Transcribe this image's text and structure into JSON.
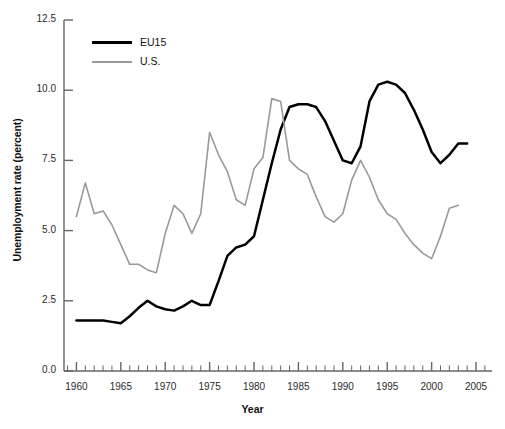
{
  "chart_data": {
    "type": "line",
    "title": "",
    "xlabel": "Year",
    "ylabel": "Unemployment rate (percent)",
    "xlim": [
      1958.6,
      2006.8
    ],
    "ylim": [
      0.0,
      12.5
    ],
    "grid": false,
    "legend_position": "top-left inside axes",
    "y_ticks": [
      "0.0",
      "2.5",
      "5.0",
      "7.5",
      "10.0",
      "12.5"
    ],
    "y_tick_values": [
      0.0,
      2.5,
      5.0,
      7.5,
      10.0,
      12.5
    ],
    "x_ticks": [
      "1960",
      "1965",
      "1970",
      "1975",
      "1980",
      "1985",
      "1990",
      "1995",
      "2000",
      "2005"
    ],
    "x_tick_values": [
      1960,
      1965,
      1970,
      1975,
      1980,
      1985,
      1990,
      1995,
      2000,
      2005
    ],
    "x_minor_tick_interval": 1,
    "colors": {
      "eu15": "#000000",
      "us": "#999999",
      "axis": "#666666",
      "background": "#ffffff"
    },
    "series": [
      {
        "name": "EU15",
        "color": "#000000",
        "x": [
          1960,
          1961,
          1962,
          1963,
          1964,
          1965,
          1966,
          1967,
          1968,
          1969,
          1970,
          1971,
          1972,
          1973,
          1974,
          1975,
          1976,
          1977,
          1978,
          1979,
          1980,
          1981,
          1982,
          1983,
          1984,
          1985,
          1986,
          1987,
          1988,
          1989,
          1990,
          1991,
          1992,
          1993,
          1994,
          1995,
          1996,
          1997,
          1998,
          1999,
          2000,
          2001,
          2002,
          2003,
          2004
        ],
        "values": [
          1.8,
          1.8,
          1.8,
          1.8,
          1.75,
          1.7,
          1.95,
          2.25,
          2.5,
          2.3,
          2.2,
          2.15,
          2.3,
          2.5,
          2.35,
          2.35,
          3.2,
          4.1,
          4.4,
          4.5,
          4.8,
          6.1,
          7.4,
          8.6,
          9.4,
          9.5,
          9.5,
          9.4,
          8.9,
          8.2,
          7.5,
          7.4,
          8.0,
          9.6,
          10.2,
          10.3,
          10.2,
          9.9,
          9.3,
          8.6,
          7.8,
          7.4,
          7.7,
          8.1,
          8.1
        ]
      },
      {
        "name": "U.S.",
        "color": "#999999",
        "x": [
          1960,
          1961,
          1962,
          1963,
          1964,
          1965,
          1966,
          1967,
          1968,
          1969,
          1970,
          1971,
          1972,
          1973,
          1974,
          1975,
          1976,
          1977,
          1978,
          1979,
          1980,
          1981,
          1982,
          1983,
          1984,
          1985,
          1986,
          1987,
          1988,
          1989,
          1990,
          1991,
          1992,
          1993,
          1994,
          1995,
          1996,
          1997,
          1998,
          1999,
          2000,
          2001,
          2002,
          2003
        ],
        "values": [
          5.5,
          6.7,
          5.6,
          5.7,
          5.2,
          4.5,
          3.8,
          3.8,
          3.6,
          3.5,
          4.9,
          5.9,
          5.6,
          4.9,
          5.6,
          8.5,
          7.7,
          7.1,
          6.1,
          5.9,
          7.2,
          7.6,
          9.7,
          9.6,
          7.5,
          7.2,
          7.0,
          6.2,
          5.5,
          5.3,
          5.6,
          6.8,
          7.5,
          6.9,
          6.1,
          5.6,
          5.4,
          4.9,
          4.5,
          4.2,
          4.0,
          4.8,
          5.8,
          5.9
        ]
      }
    ]
  },
  "axes_geometry": {
    "plot_left": 64,
    "plot_right": 492,
    "plot_top": 20,
    "plot_bottom": 371
  },
  "legend": {
    "entries": [
      {
        "label": "EU15",
        "series": "eu15"
      },
      {
        "label": "U.S.",
        "series": "us"
      }
    ]
  }
}
